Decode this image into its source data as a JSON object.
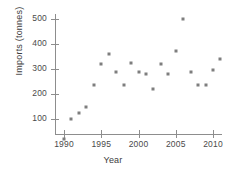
{
  "chart_data": {
    "type": "scatter",
    "title": "",
    "xlabel": "Year",
    "ylabel": "Imports (tonnes)",
    "xlim": [
      1988.8,
      2012.4
    ],
    "ylim": [
      0,
      540
    ],
    "grid": false,
    "legend": null,
    "marker": {
      "shape": "square",
      "color": "#7e7e7e",
      "size_px": 3
    },
    "axis_color": "#8d8d8d",
    "xticks": [
      1990,
      1995,
      2000,
      2005,
      2010
    ],
    "xticklabels": [
      "1990",
      "1995",
      "2000",
      "2005",
      "2010"
    ],
    "yticks": [
      100,
      200,
      300,
      400,
      500
    ],
    "yticklabels": [
      "100",
      "200",
      "300",
      "400",
      "500"
    ],
    "x": [
      1990,
      1991,
      1992,
      1993,
      1994,
      1995,
      1996,
      1997,
      1998,
      1999,
      2000,
      2001,
      2002,
      2003,
      2004,
      2005,
      2006,
      2007,
      2008,
      2009,
      2010,
      2011
    ],
    "values": [
      20,
      100,
      125,
      148,
      235,
      320,
      360,
      288,
      235,
      325,
      290,
      280,
      220,
      320,
      280,
      372,
      500,
      290,
      238,
      238,
      298,
      340
    ],
    "points": [
      {
        "x": 1990,
        "y": 20
      },
      {
        "x": 1991,
        "y": 100
      },
      {
        "x": 1992,
        "y": 125
      },
      {
        "x": 1993,
        "y": 148
      },
      {
        "x": 1994,
        "y": 235
      },
      {
        "x": 1995,
        "y": 320
      },
      {
        "x": 1996,
        "y": 360
      },
      {
        "x": 1997,
        "y": 288
      },
      {
        "x": 1998,
        "y": 235
      },
      {
        "x": 1999,
        "y": 325
      },
      {
        "x": 2000,
        "y": 290
      },
      {
        "x": 2001,
        "y": 280
      },
      {
        "x": 2002,
        "y": 220
      },
      {
        "x": 2003,
        "y": 320
      },
      {
        "x": 2004,
        "y": 280
      },
      {
        "x": 2005,
        "y": 372
      },
      {
        "x": 2006,
        "y": 500
      },
      {
        "x": 2007,
        "y": 290
      },
      {
        "x": 2008,
        "y": 238
      },
      {
        "x": 2009,
        "y": 238
      },
      {
        "x": 2010,
        "y": 298
      },
      {
        "x": 2011,
        "y": 340
      }
    ]
  }
}
